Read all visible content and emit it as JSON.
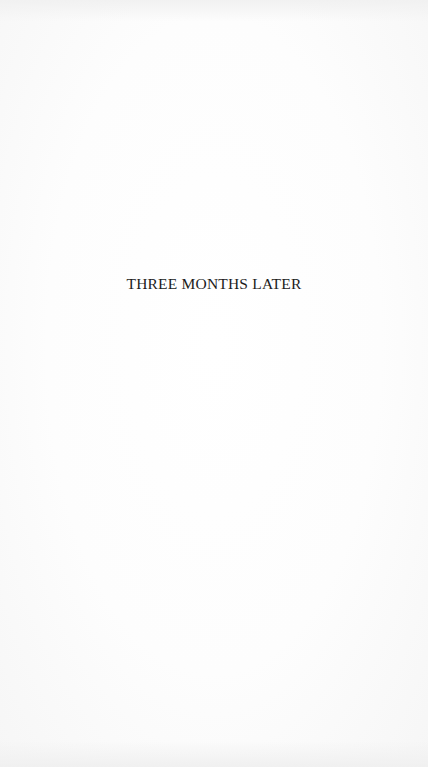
{
  "page": {
    "heading": "THREE MONTHS LATER",
    "background_color": "#fbfbfb",
    "text_color": "#1c1c1c"
  }
}
